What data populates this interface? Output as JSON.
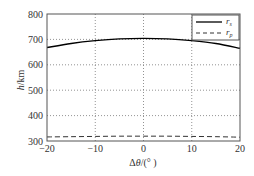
{
  "chart_data": {
    "type": "line",
    "title": "",
    "xlabel": "Δθ/(°)",
    "ylabel": "h/km",
    "xlim": [
      -20,
      20
    ],
    "ylim": [
      300,
      800
    ],
    "xticks": [
      -20,
      -10,
      0,
      10,
      20
    ],
    "xtick_labels": [
      "−20",
      "−10",
      "0",
      "10",
      "20"
    ],
    "yticks": [
      300,
      400,
      500,
      600,
      700,
      800
    ],
    "ytick_labels": [
      "300",
      "400",
      "500",
      "600",
      "700",
      "800"
    ],
    "grid": true,
    "grid_style": "dotted",
    "legend_position": "upper right",
    "x": [
      -20,
      -15,
      -10,
      -5,
      0,
      5,
      10,
      15,
      20
    ],
    "series": [
      {
        "name": "r_s",
        "label_main": "r",
        "label_sub": "s",
        "style": "solid",
        "color": "#000000",
        "values": [
          668,
          684,
          695,
          702,
          704,
          702,
          695,
          684,
          665
        ]
      },
      {
        "name": "r_p",
        "label_main": "r",
        "label_sub": "p",
        "style": "dashed",
        "color": "#333333",
        "values": [
          316,
          317,
          318,
          319,
          319,
          319,
          318,
          317,
          315
        ]
      }
    ]
  },
  "axes": {
    "xlabel_main": "Δθ",
    "xlabel_unit": "/(°  )",
    "ylabel": "h/km"
  }
}
